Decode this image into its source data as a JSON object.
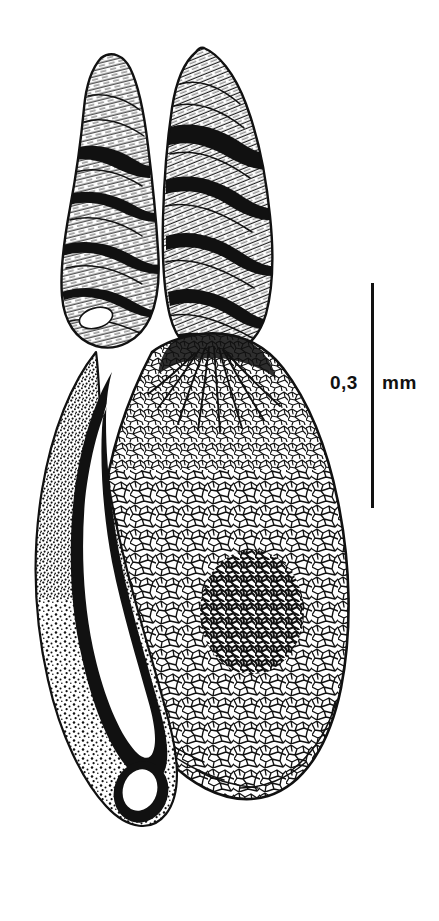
{
  "figure": {
    "kind": "scientific-line-drawing",
    "background_color": "#ffffff",
    "ink_color": "#111111",
    "width": 439,
    "height": 921
  },
  "scale_bar": {
    "value": "0,3",
    "unit": "mm",
    "full_label": "0,3 mm",
    "orientation": "vertical",
    "bar_color": "#111111",
    "bar_x": 373,
    "bar_top": 283,
    "bar_bottom": 508,
    "bar_length_px": 225,
    "bar_thickness_px": 3
  },
  "parts": [
    {
      "name": "left-lobe",
      "description": "finger-like tubular lobe, transversely banded, with solid black shadow bands"
    },
    {
      "name": "right-lobe",
      "description": "finger-like tubular lobe, transversely banded, with solid black shadow bands"
    },
    {
      "name": "central-body",
      "description": "large pear-shaped body covered in reticulate polygonal cell network"
    },
    {
      "name": "dense-reticulation-patch",
      "description": "darker denser cluster of reticulation near lower centre"
    },
    {
      "name": "left-appendage",
      "description": "curved slender tube with stippled granular wall and dark internal duct ending in a blind sac"
    },
    {
      "name": "lobe-junction",
      "description": "V-shaped notch where the two lobes converge, with radiating lines fanning into the body"
    }
  ]
}
